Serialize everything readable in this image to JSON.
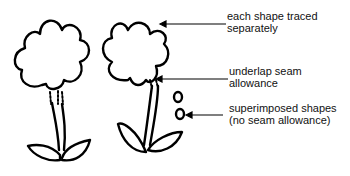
{
  "diagram": {
    "labels": [
      {
        "id": "traced",
        "lines": [
          "each shape traced",
          "separately"
        ]
      },
      {
        "id": "underlap",
        "lines": [
          "underlap seam",
          "allowance"
        ]
      },
      {
        "id": "superimposed",
        "lines": [
          "superimposed shapes",
          "(no seam allowance)"
        ]
      }
    ],
    "figures": [
      "flower-assembled",
      "flower-exploded"
    ],
    "colors": {
      "stroke": "#000000",
      "background": "#ffffff"
    }
  }
}
